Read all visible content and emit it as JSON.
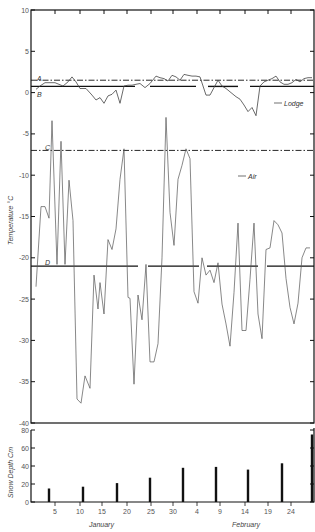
{
  "chart_data": [
    {
      "type": "line",
      "title": "",
      "xlabel": "",
      "ylabel": "Temperature °C",
      "ylim": [
        -40,
        10
      ],
      "yticks": [
        10,
        5,
        0,
        -5,
        -10,
        -15,
        -20,
        -25,
        -30,
        -35,
        -40
      ],
      "grid": false,
      "reference_lines": [
        {
          "label": "A",
          "value": 1.5,
          "style": "dash-dot"
        },
        {
          "label": "B",
          "value": 0.8,
          "style": "solid-segmented"
        },
        {
          "label": "C",
          "value": -7,
          "style": "dash-dot"
        },
        {
          "label": "D",
          "value": -21,
          "style": "solid-segmented"
        }
      ],
      "annotations": [
        "Lodge",
        "Air"
      ],
      "series": [
        {
          "name": "Lodge",
          "x_px": [
            36,
            40,
            45,
            55,
            63,
            68,
            72,
            76,
            80,
            86,
            92,
            96,
            100,
            104,
            108,
            112,
            116,
            120,
            124,
            128,
            132,
            136,
            140,
            145,
            150,
            156,
            160,
            164,
            168,
            172,
            176,
            180,
            184,
            188,
            192,
            196,
            200,
            206,
            210,
            214,
            218,
            222,
            226,
            230,
            236,
            240,
            244,
            248,
            252,
            256,
            260,
            264,
            268,
            272,
            276,
            280,
            284,
            288,
            292,
            296,
            300,
            304,
            308,
            312
          ],
          "values": [
            0.4,
            0.8,
            1.2,
            1.2,
            0.8,
            1.3,
            1.9,
            1.3,
            0.5,
            0.5,
            -0.3,
            -0.9,
            -0.6,
            -1.3,
            -0.4,
            -0.2,
            0.3,
            -1.3,
            0.8,
            0.9,
            0.9,
            1.0,
            1.1,
            0.6,
            1.1,
            2.0,
            1.8,
            1.7,
            1.4,
            2.1,
            1.9,
            1.5,
            2.2,
            2.1,
            2.0,
            2.0,
            1.9,
            -0.3,
            -0.3,
            0.6,
            1.5,
            0.8,
            0.5,
            0.1,
            -0.5,
            -0.8,
            -1.5,
            -2.3,
            -1.8,
            -2.8,
            0.8,
            1.3,
            1.5,
            1.7,
            2.0,
            1.3,
            1.0,
            1.0,
            1.2,
            1.6,
            1.3,
            1.7,
            1.8,
            1.8
          ]
        },
        {
          "name": "Air",
          "x_px": [
            36,
            41,
            45,
            49,
            52,
            57,
            61,
            65,
            69,
            73,
            77,
            81,
            85,
            90,
            94,
            98,
            100,
            104,
            108,
            112,
            116,
            120,
            124,
            128,
            130,
            134,
            138,
            142,
            146,
            150,
            154,
            158,
            162,
            166,
            170,
            174,
            178,
            182,
            186,
            190,
            194,
            198,
            202,
            206,
            210,
            214,
            218,
            222,
            226,
            230,
            234,
            238,
            242,
            246,
            250,
            254,
            258,
            262,
            266,
            270,
            274,
            278,
            282,
            286,
            290,
            294,
            298,
            302,
            306,
            310
          ],
          "values": [
            -23.5,
            -13.8,
            -13.8,
            -15.2,
            -3.4,
            -20.8,
            -5.9,
            -20.8,
            -10.6,
            -15.5,
            -37.1,
            -37.6,
            -34.3,
            -35.8,
            -22.1,
            -26.2,
            -23.0,
            -26.8,
            -17.8,
            -19.0,
            -16.5,
            -10.5,
            -6.8,
            -24.8,
            -24.9,
            -35.3,
            -24.5,
            -27.5,
            -20.8,
            -32.6,
            -32.6,
            -30.4,
            -20.0,
            -3.0,
            -14.5,
            -18.5,
            -10.5,
            -8.8,
            -6.8,
            -8.0,
            -24.1,
            -25.5,
            -20.0,
            -22.1,
            -21.5,
            -23.0,
            -20.6,
            -25.6,
            -28.0,
            -30.7,
            -24.2,
            -15.8,
            -28.8,
            -28.8,
            -22.6,
            -15.8,
            -26.8,
            -29.8,
            -19.0,
            -18.8,
            -15.5,
            -16.0,
            -17.0,
            -22.5,
            -26.0,
            -28.0,
            -25.5,
            -20.0,
            -18.8,
            -18.8
          ]
        }
      ]
    },
    {
      "type": "bar",
      "title": "",
      "xlabel": "January / February",
      "ylabel": "Snow Depth Cm",
      "ylim": [
        0,
        80
      ],
      "yticks": [
        0,
        20,
        40,
        60,
        80
      ],
      "categories": [
        "Jan 4",
        "Jan 11",
        "Jan 18",
        "Jan 25",
        "Feb 1",
        "Feb 8",
        "Feb 15",
        "Feb 22",
        "Feb 28"
      ],
      "values": [
        15,
        17,
        21,
        27,
        38,
        39,
        36,
        43,
        75
      ],
      "xtick_labels": [
        "5",
        "10",
        "15",
        "20",
        "25",
        "30",
        "4",
        "9",
        "14",
        "19",
        "24"
      ],
      "month_labels": [
        "January",
        "February"
      ]
    }
  ],
  "labels": {
    "temp_axis_title": "Temperature °C",
    "snow_axis_title": "Snow  Depth  Cm",
    "ref_A": "A",
    "ref_B": "B",
    "ref_C": "C",
    "ref_D": "D",
    "lodge": "Lodge",
    "air": "Air",
    "january": "January",
    "february": "February"
  },
  "temp_ticks": [
    "10",
    "5",
    "0",
    "-5",
    "-10",
    "-15",
    "-20",
    "-25",
    "-30",
    "-35",
    "-40"
  ],
  "snow_ticks": [
    "80",
    "60",
    "40",
    "20",
    "0"
  ],
  "day_ticks": [
    "5",
    "10",
    "15",
    "20",
    "25",
    "30",
    "4",
    "9",
    "14",
    "19",
    "24"
  ]
}
